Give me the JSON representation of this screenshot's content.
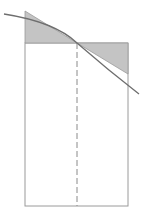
{
  "diagram": {
    "type": "tangent-line-midpoint-rectangle",
    "colors": {
      "background": "#ffffff",
      "outline": "#9a9a9a",
      "shade": "#c4c4c4",
      "curve": "#6e6e6e",
      "dashed": "#8a8a8a"
    },
    "rectangle": {
      "x1": 25,
      "x2": 128,
      "top": 43,
      "bottom": 206
    },
    "midpoint": {
      "x": 77,
      "y": 43
    },
    "left_triangle": [
      [
        25,
        11
      ],
      [
        77,
        43
      ],
      [
        25,
        43
      ]
    ],
    "right_triangle": [
      [
        77,
        43
      ],
      [
        128,
        43
      ],
      [
        128,
        74
      ]
    ],
    "curve_path": "M4,14 Q60,26 77,43 Q108,70 139,94"
  }
}
